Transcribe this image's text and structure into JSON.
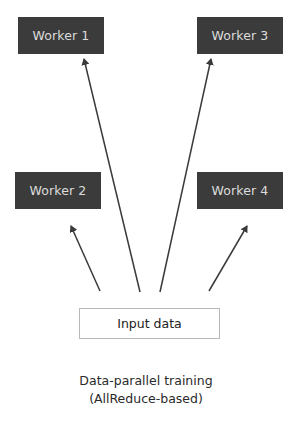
{
  "diagram": {
    "workers": [
      {
        "id": "w1",
        "label": "Worker 1"
      },
      {
        "id": "w2",
        "label": "Worker 2"
      },
      {
        "id": "w3",
        "label": "Worker 3"
      },
      {
        "id": "w4",
        "label": "Worker 4"
      }
    ],
    "input": {
      "label": "Input data"
    },
    "edges": [
      {
        "from": "input",
        "to": "Worker 1"
      },
      {
        "from": "input",
        "to": "Worker 2"
      },
      {
        "from": "input",
        "to": "Worker 3"
      },
      {
        "from": "input",
        "to": "Worker 4"
      }
    ],
    "caption": {
      "line1": "Data-parallel training",
      "line2": "(AllReduce-based)"
    },
    "colors": {
      "worker_fill": "#3b3b3b",
      "worker_text": "#dcdcdc",
      "arrow": "#3a3a3a",
      "input_border": "#b8b8b8"
    }
  }
}
